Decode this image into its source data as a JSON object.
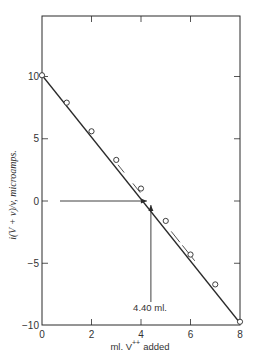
{
  "chart_data": {
    "type": "line",
    "title": "",
    "xlabel": "ml. V++ added",
    "xlabel_main": "ml. V",
    "xlabel_sup": "++",
    "xlabel_tail": "added",
    "ylabel": "i(V + v)/v, microamps.",
    "xlim": [
      0,
      8
    ],
    "ylim": [
      -10,
      15
    ],
    "xticks": [
      0,
      2,
      4,
      6,
      8
    ],
    "yticks": [
      -10,
      -5,
      0,
      5,
      10
    ],
    "xtick_labels": [
      "0",
      "2",
      "4",
      "6",
      "8"
    ],
    "ytick_labels": [
      "−10",
      "−5",
      "0",
      "5",
      "10"
    ],
    "grid": false,
    "legend": null,
    "series": [
      {
        "name": "measured",
        "marker": "open-circle",
        "x": [
          0,
          1,
          2,
          3,
          4,
          5,
          6,
          7,
          8
        ],
        "y": [
          10.1,
          7.9,
          5.6,
          3.3,
          1.0,
          -1.6,
          -4.3,
          -6.7,
          -9.7
        ]
      }
    ],
    "fit_line": {
      "x": [
        0,
        8
      ],
      "y": [
        10.1,
        -9.8
      ]
    },
    "annotations": [
      {
        "text": "4.40 ml.",
        "x": 4.4,
        "y": 0,
        "type": "arrow-to-intercept"
      }
    ],
    "endpoint_ml": 4.4
  },
  "colors": {
    "ink": "#2a2a2a",
    "background": "#ffffff"
  }
}
